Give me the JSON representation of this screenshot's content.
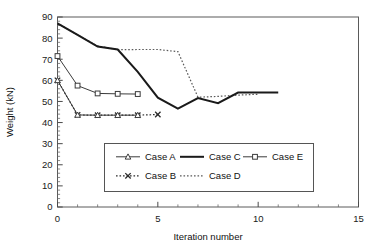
{
  "chart_data": {
    "type": "line",
    "title": "",
    "xlabel": "Iteration number",
    "ylabel": "Weight (kN)",
    "xlim": [
      0,
      15
    ],
    "ylim": [
      0,
      90
    ],
    "xticks": [
      0,
      5,
      10,
      15
    ],
    "xtick_labels": [
      "0",
      "5",
      "10",
      "15"
    ],
    "yticks": [
      0,
      10,
      20,
      30,
      40,
      50,
      60,
      70,
      80,
      90
    ],
    "ytick_labels": [
      "0",
      "10",
      "20",
      "30",
      "40",
      "50",
      "60",
      "70",
      "80",
      "90"
    ],
    "x_minor_step": 1,
    "y_minor_step": 2,
    "grid": false,
    "frame": true,
    "legend_position": "inside-lower-center",
    "series": [
      {
        "name": "Case A",
        "marker": "triangle",
        "linestyle": "solid",
        "color": "#3b3b3b",
        "x": [
          0,
          1,
          2,
          3,
          4
        ],
        "y": [
          60.0,
          43.6,
          43.5,
          43.5,
          43.5
        ]
      },
      {
        "name": "Case C",
        "marker": "none",
        "linestyle": "solid-thick",
        "color": "#1a1a1a",
        "x": [
          0,
          1,
          2,
          3,
          4,
          5,
          6,
          7,
          8,
          9,
          10,
          11
        ],
        "y": [
          87.0,
          81.5,
          76.0,
          74.6,
          64.0,
          51.8,
          46.6,
          51.6,
          49.2,
          54.2,
          54.2,
          54.2
        ]
      },
      {
        "name": "Case E",
        "marker": "square",
        "linestyle": "solid",
        "color": "#3b3b3b",
        "x": [
          0,
          1,
          2,
          3,
          4
        ],
        "y": [
          71.5,
          57.5,
          53.8,
          53.6,
          53.5
        ]
      },
      {
        "name": "Case B",
        "marker": "x",
        "linestyle": "dotted",
        "color": "#2a2a2a",
        "x": [
          0,
          1,
          2,
          3,
          4,
          5
        ],
        "y": [
          60.0,
          43.6,
          43.5,
          43.5,
          43.5,
          43.8
        ]
      },
      {
        "name": "Case D",
        "marker": "none",
        "linestyle": "dotted",
        "color": "#5a5a5a",
        "x": [
          0,
          1,
          2,
          3,
          4,
          5,
          6,
          7,
          8,
          9,
          10
        ],
        "y": [
          87.0,
          81.5,
          76.3,
          74.5,
          74.6,
          74.6,
          73.6,
          52.0,
          52.4,
          53.0,
          53.4
        ]
      }
    ],
    "legend_rows": [
      [
        "Case A",
        "Case C",
        "Case E"
      ],
      [
        "Case B",
        "Case D"
      ]
    ]
  }
}
